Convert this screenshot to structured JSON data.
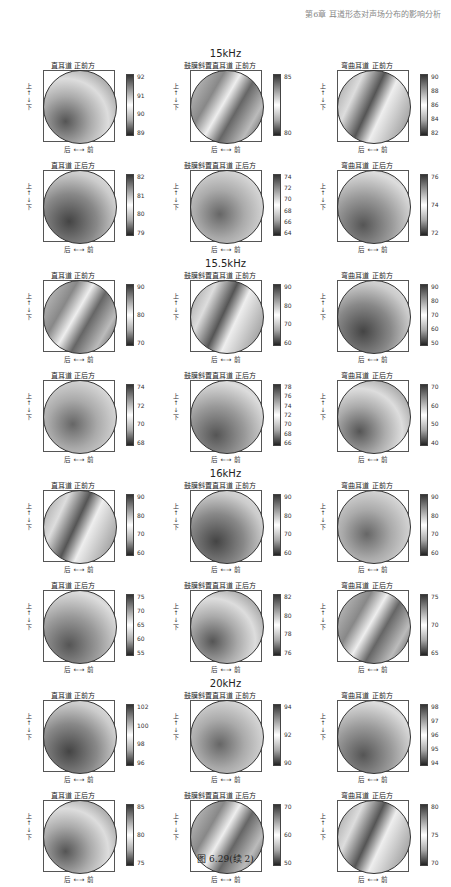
{
  "header": {
    "text": "第6章 耳道形态对声场分布的影响分析"
  },
  "caption": "图 6.29(续 2)",
  "axes": {
    "x_label": "后 ←→ 前",
    "y_label": "下 ←→ 上"
  },
  "groups": [
    {
      "title": "15kHz",
      "top": 60
    },
    {
      "title": "15.5kHz",
      "top": 270
    },
    {
      "title": "16kHz",
      "top": 480
    },
    {
      "title": "20kHz",
      "top": 690
    }
  ],
  "chart_data": [
    {
      "type": "heatmap",
      "group": "15kHz",
      "title": "直耳道 正前方",
      "colorbar_ticks": [
        "92",
        "91",
        "90",
        "89"
      ]
    },
    {
      "type": "heatmap",
      "group": "15kHz",
      "title": "鼓膜斜置直耳道 正前方",
      "colorbar_ticks": [
        "85",
        "80"
      ]
    },
    {
      "type": "heatmap",
      "group": "15kHz",
      "title": "弯曲耳道 正前方",
      "colorbar_ticks": [
        "90",
        "88",
        "86",
        "84",
        "82"
      ]
    },
    {
      "type": "heatmap",
      "group": "15kHz",
      "title": "直耳道 正后方",
      "colorbar_ticks": [
        "82",
        "81",
        "80",
        "79"
      ]
    },
    {
      "type": "heatmap",
      "group": "15kHz",
      "title": "鼓膜斜置直耳道 正后方",
      "colorbar_ticks": [
        "74",
        "72",
        "70",
        "68",
        "66",
        "64"
      ]
    },
    {
      "type": "heatmap",
      "group": "15kHz",
      "title": "弯曲耳道 正后方",
      "colorbar_ticks": [
        "76",
        "74",
        "72"
      ]
    },
    {
      "type": "heatmap",
      "group": "15.5kHz",
      "title": "直耳道 正前方",
      "colorbar_ticks": [
        "90",
        "80",
        "70"
      ]
    },
    {
      "type": "heatmap",
      "group": "15.5kHz",
      "title": "鼓膜斜置直耳道 正前方",
      "colorbar_ticks": [
        "90",
        "80",
        "70",
        "60"
      ]
    },
    {
      "type": "heatmap",
      "group": "15.5kHz",
      "title": "弯曲耳道 正前方",
      "colorbar_ticks": [
        "90",
        "80",
        "70",
        "60",
        "50"
      ]
    },
    {
      "type": "heatmap",
      "group": "15.5kHz",
      "title": "直耳道 正后方",
      "colorbar_ticks": [
        "74",
        "72",
        "70",
        "68"
      ]
    },
    {
      "type": "heatmap",
      "group": "15.5kHz",
      "title": "鼓膜斜置直耳道 正后方",
      "colorbar_ticks": [
        "78",
        "76",
        "74",
        "72",
        "70",
        "68",
        "66"
      ]
    },
    {
      "type": "heatmap",
      "group": "15.5kHz",
      "title": "弯曲耳道 正后方",
      "colorbar_ticks": [
        "70",
        "60",
        "50",
        "40"
      ]
    },
    {
      "type": "heatmap",
      "group": "16kHz",
      "title": "直耳道 正前方",
      "colorbar_ticks": [
        "90",
        "80",
        "70",
        "60"
      ]
    },
    {
      "type": "heatmap",
      "group": "16kHz",
      "title": "鼓膜斜置直耳道 正前方",
      "colorbar_ticks": [
        "90",
        "80",
        "70",
        "60"
      ]
    },
    {
      "type": "heatmap",
      "group": "16kHz",
      "title": "弯曲耳道 正前方",
      "colorbar_ticks": [
        "90",
        "80",
        "70",
        "60"
      ]
    },
    {
      "type": "heatmap",
      "group": "16kHz",
      "title": "直耳道 正后方",
      "colorbar_ticks": [
        "75",
        "70",
        "65",
        "60",
        "55"
      ]
    },
    {
      "type": "heatmap",
      "group": "16kHz",
      "title": "鼓膜斜置直耳道 正后方",
      "colorbar_ticks": [
        "82",
        "80",
        "78",
        "76"
      ]
    },
    {
      "type": "heatmap",
      "group": "16kHz",
      "title": "弯曲耳道 正后方",
      "colorbar_ticks": [
        "75",
        "70",
        "65"
      ]
    },
    {
      "type": "heatmap",
      "group": "20kHz",
      "title": "直耳道 正前方",
      "colorbar_ticks": [
        "102",
        "100",
        "98",
        "96"
      ]
    },
    {
      "type": "heatmap",
      "group": "20kHz",
      "title": "鼓膜斜置直耳道 正前方",
      "colorbar_ticks": [
        "94",
        "92",
        "90"
      ]
    },
    {
      "type": "heatmap",
      "group": "20kHz",
      "title": "弯曲耳道 正前方",
      "colorbar_ticks": [
        "98",
        "97",
        "96",
        "95",
        "94"
      ]
    },
    {
      "type": "heatmap",
      "group": "20kHz",
      "title": "直耳道 正后方",
      "colorbar_ticks": [
        "85",
        "80",
        "75"
      ]
    },
    {
      "type": "heatmap",
      "group": "20kHz",
      "title": "鼓膜斜置直耳道 正后方",
      "colorbar_ticks": [
        "70",
        "60",
        "50"
      ]
    },
    {
      "type": "heatmap",
      "group": "20kHz",
      "title": "弯曲耳道 正后方",
      "colorbar_ticks": [
        "80",
        "75",
        "70"
      ]
    }
  ]
}
